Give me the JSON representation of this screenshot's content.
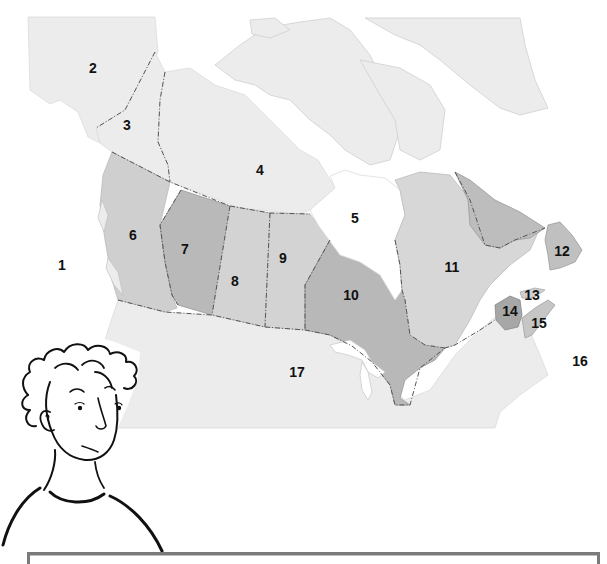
{
  "map": {
    "title": "Map of Canada with numbered regions",
    "colors": {
      "land_light": "#ececec",
      "land_mid": "#d9d9d9",
      "land_dark": "#c6c6c6",
      "land_darker": "#b3b3b3",
      "water": "#ffffff",
      "border": "#555555"
    },
    "labels": [
      {
        "id": "1",
        "text": "1",
        "x": 62,
        "y": 265
      },
      {
        "id": "2",
        "text": "2",
        "x": 93,
        "y": 68
      },
      {
        "id": "3",
        "text": "3",
        "x": 127,
        "y": 125
      },
      {
        "id": "4",
        "text": "4",
        "x": 260,
        "y": 170
      },
      {
        "id": "5",
        "text": "5",
        "x": 355,
        "y": 218
      },
      {
        "id": "6",
        "text": "6",
        "x": 133,
        "y": 235
      },
      {
        "id": "7",
        "text": "7",
        "x": 185,
        "y": 249
      },
      {
        "id": "8",
        "text": "8",
        "x": 235,
        "y": 281
      },
      {
        "id": "9",
        "text": "9",
        "x": 283,
        "y": 258
      },
      {
        "id": "10",
        "text": "10",
        "x": 351,
        "y": 295
      },
      {
        "id": "11",
        "text": "11",
        "x": 452,
        "y": 267
      },
      {
        "id": "12",
        "text": "12",
        "x": 562,
        "y": 251
      },
      {
        "id": "13",
        "text": "13",
        "x": 532,
        "y": 295
      },
      {
        "id": "14",
        "text": "14",
        "x": 510,
        "y": 311
      },
      {
        "id": "15",
        "text": "15",
        "x": 539,
        "y": 323
      },
      {
        "id": "16",
        "text": "16",
        "x": 580,
        "y": 361
      },
      {
        "id": "17",
        "text": "17",
        "x": 297,
        "y": 372
      }
    ]
  },
  "character": {
    "description": "line-drawn person with curly hair looking at map"
  },
  "answer_bar": {
    "text": ""
  }
}
